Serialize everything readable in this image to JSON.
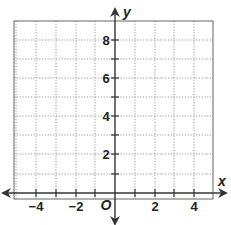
{
  "figure": {
    "type": "coordinate-grid",
    "x_axis_label": "x",
    "y_axis_label": "y",
    "origin_label": "O",
    "x_tick_labels": [
      "−4",
      "−2",
      "2",
      "4"
    ],
    "y_tick_labels": [
      "8",
      "6",
      "4",
      "2"
    ],
    "x_range": [
      -5,
      5
    ],
    "y_range": [
      -1,
      9
    ],
    "grid": "dotted",
    "colors": {
      "axis": "#333333",
      "grid": "#999999",
      "border": "#555555",
      "text": "#222222"
    }
  }
}
